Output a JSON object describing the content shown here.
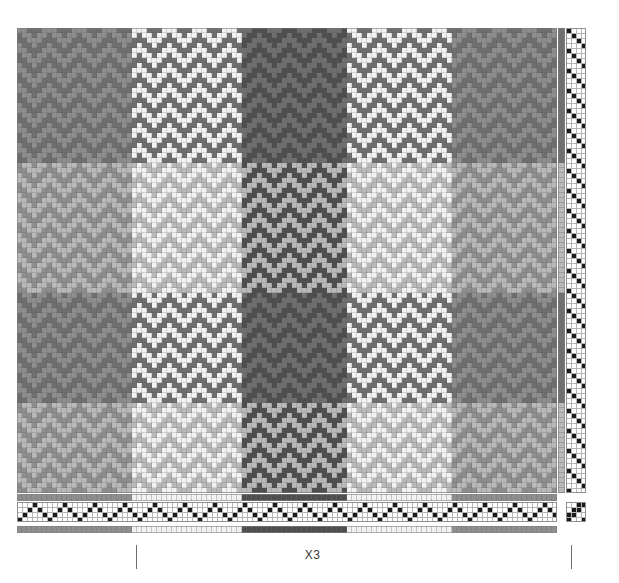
{
  "document": {
    "kind": "weaving-draft",
    "title": "Weaving draft drawdown"
  },
  "annotation": {
    "repeat_label": "X3",
    "tick_left_x": 136,
    "tick_right_x": 571
  },
  "palette": {
    "white": "#ffffff",
    "light": "#e9e9e9",
    "mid_light": "#c9c9c9",
    "mid": "#9a9a9a",
    "mid_dark": "#7a7a7a",
    "dark": "#5a5a5a",
    "darker": "#4a4a4a",
    "black": "#1a1a1a",
    "grid_line": "#8f8f8f",
    "cell_border": "#b4b4b4",
    "ink": "#3a3a3a",
    "tick": "#6d6d6d"
  },
  "layout": {
    "cell": 5,
    "drawdown": {
      "x": 17,
      "y": 28,
      "warp_ends": 108,
      "weft_picks": 93
    },
    "threading": {
      "x": 17,
      "y": 502,
      "shafts": 4,
      "rows": 4
    },
    "treadling": {
      "x": 566,
      "y": 28,
      "treadles": 4
    },
    "tieup": {
      "x": 566,
      "y": 502,
      "rows": 4,
      "cols": 4
    },
    "warp_color_bar": {
      "x": 17,
      "y": 494,
      "height": 7
    },
    "warp_color_bar_2": {
      "x": 17,
      "y": 526,
      "height": 7
    },
    "weft_color_bar": {
      "x": 558,
      "y": 28,
      "width": 7
    }
  },
  "chart_data": {
    "type": "heatmap",
    "xlabel": "warp ends",
    "ylabel": "weft picks",
    "grid": true,
    "legend": "none",
    "structure": {
      "shafts": 4,
      "treadles": 4,
      "tieup": [
        [
          1,
          1,
          0,
          0
        ],
        [
          0,
          1,
          1,
          0
        ],
        [
          0,
          0,
          1,
          1
        ],
        [
          1,
          0,
          0,
          1
        ]
      ],
      "threading_note": "point twill, zigzag 1-2-3-4-3-2 with straight-run sections",
      "treadling_note": "straight descending twill 1-2-3-4 repeat"
    },
    "warp_color_sequence": [
      {
        "color": "#8e8e8e",
        "ends": 23,
        "name": "gray"
      },
      {
        "color": "#f2f2f2",
        "ends": 22,
        "name": "white"
      },
      {
        "color": "#4e4e4e",
        "ends": 21,
        "name": "charcoal"
      },
      {
        "color": "#f2f2f2",
        "ends": 21,
        "name": "white"
      },
      {
        "color": "#8e8e8e",
        "ends": 21,
        "name": "gray"
      }
    ],
    "weft_color_sequence": [
      {
        "color": "#6f6f6f",
        "picks": 27,
        "name": "dark gray"
      },
      {
        "color": "#b9b9b9",
        "picks": 26,
        "name": "light gray"
      },
      {
        "color": "#6f6f6f",
        "picks": 22,
        "name": "dark gray"
      },
      {
        "color": "#b9b9b9",
        "picks": 18,
        "name": "light gray"
      }
    ]
  }
}
